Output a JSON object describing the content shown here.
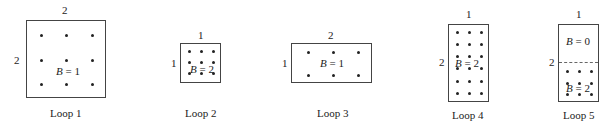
{
  "figure": {
    "loops": [
      {
        "caption": "Loop 1",
        "width_label": "2",
        "height_label": "2",
        "field": {
          "var": "B",
          "eq": " = 1"
        }
      },
      {
        "caption": "Loop 2",
        "width_label": "1",
        "height_label": "1",
        "field": {
          "var": "B",
          "eq": " = 2"
        }
      },
      {
        "caption": "Loop 3",
        "width_label": "2",
        "height_label": "1",
        "field": {
          "var": "B",
          "eq": " = 1"
        }
      },
      {
        "caption": "Loop 4",
        "width_label": "1",
        "height_label": "2",
        "field": {
          "var": "B",
          "eq": " = 2"
        }
      },
      {
        "caption": "Loop 5",
        "width_label": "1",
        "height_label": "2",
        "field_top": {
          "var": "B",
          "eq": " = 0"
        },
        "field_bottom": {
          "var": "B",
          "eq": " = 2"
        }
      }
    ]
  }
}
